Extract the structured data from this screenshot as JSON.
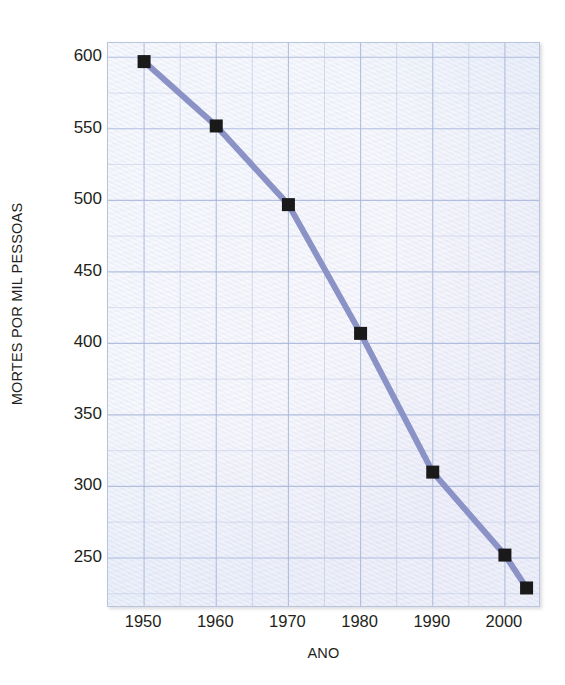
{
  "chart_data": {
    "type": "line",
    "title": "",
    "xlabel": "ANO",
    "ylabel": "MORTES POR MIL PESSOAS",
    "xlim": [
      1945,
      2005
    ],
    "ylim": [
      215,
      610
    ],
    "grid": true,
    "legend": false,
    "x": [
      1950,
      1960,
      1970,
      1980,
      1990,
      2000,
      2003
    ],
    "values": [
      597,
      552,
      497,
      407,
      310,
      252,
      229
    ],
    "series": [
      {
        "name": "Mortes por mil pessoas",
        "x": [
          1950,
          1960,
          1970,
          1980,
          1990,
          2000,
          2003
        ],
        "values": [
          597,
          552,
          497,
          407,
          310,
          252,
          229
        ]
      }
    ],
    "xticks": [
      1950,
      1960,
      1970,
      1980,
      1990,
      2000
    ],
    "xtick_labels": [
      "1950",
      "1960",
      "1970",
      "1980",
      "1990",
      "2000"
    ],
    "yticks": [
      250,
      300,
      350,
      400,
      450,
      500,
      550,
      600
    ],
    "ytick_labels": [
      "250",
      "300",
      "350",
      "400",
      "450",
      "500",
      "550",
      "600"
    ],
    "line_color": "#8a92c6",
    "marker_color": "#1a1a1a",
    "marker_style": "square",
    "plot_background": "#e4ecf8",
    "grid_color": "#a8b6da",
    "minor_grid_step_x": 5,
    "minor_grid_step_y": 25
  },
  "axes": {
    "x_title": "ANO",
    "y_title": "MORTES POR MIL PESSOAS"
  }
}
